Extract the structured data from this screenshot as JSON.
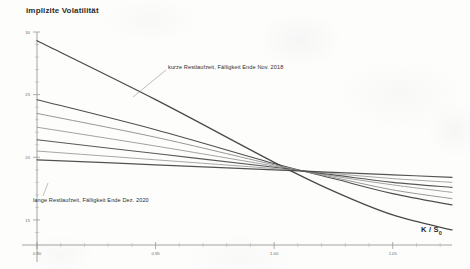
{
  "chart": {
    "title": "implizite Volatilität",
    "xlabel": "K / S",
    "xlabel_sub": "0",
    "annotations": {
      "short": "kurze Restlaufzeit, Fälligkeit Ende Nov. 2018",
      "long": "lange Restlaufzeit, Fälligkeit Ende Dez. 2020"
    }
  },
  "chart_data": {
    "type": "line",
    "title": "implizite Volatilität",
    "subtitle": "",
    "xlabel": "K / S0",
    "ylabel": "implizite Volatilität",
    "xlim": [
      0.9,
      1.075
    ],
    "ylim": [
      13.0,
      30.0
    ],
    "xticks": [
      0.9,
      0.95,
      1.0,
      1.05
    ],
    "xtick_labels": [
      "0.90",
      "0.95",
      "1.00",
      "1.05"
    ],
    "yticks": [
      15,
      20,
      25,
      30
    ],
    "ytick_labels": [
      "15",
      "20",
      "25",
      "30"
    ],
    "yminor_ticks": [
      14,
      16,
      17,
      18,
      19,
      21,
      22,
      23,
      24,
      26,
      27,
      28,
      29
    ],
    "grid": false,
    "legend": "none",
    "annotations": [
      {
        "text": "kurze Restlaufzeit, Fälligkeit Ende Nov. 2018",
        "points_to_series": "Nov. 2018 (kurze Restlaufzeit)",
        "point_x": 0.975,
        "point_y": 21.3
      },
      {
        "text": "lange Restlaufzeit, Fälligkeit Ende Dez. 2020",
        "points_to_series": "Dez. 2020 (lange Restlaufzeit)",
        "point_x": 0.916,
        "point_y": 18.6
      }
    ],
    "x": [
      0.9,
      0.95,
      1.0,
      1.025,
      1.05,
      1.075
    ],
    "series": [
      {
        "name": "Nov. 2018 (kurze Restlaufzeit)",
        "color": "#3a3a3a",
        "width": 1.3,
        "values": [
          29.3,
          24.6,
          19.6,
          17.3,
          15.4,
          14.2
        ]
      },
      {
        "name": "Laufzeit 2",
        "color": "#3f3f3f",
        "width": 1.1,
        "values": [
          24.6,
          22.2,
          19.5,
          18.3,
          17.1,
          16.2
        ]
      },
      {
        "name": "Laufzeit 3",
        "color": "#8e8e8e",
        "width": 1.0,
        "values": [
          23.5,
          21.6,
          19.4,
          18.4,
          17.4,
          16.7
        ]
      },
      {
        "name": "Laufzeit 4",
        "color": "#9a9a9a",
        "width": 1.0,
        "values": [
          22.4,
          20.9,
          19.3,
          18.5,
          17.8,
          17.2
        ]
      },
      {
        "name": "Laufzeit 5",
        "color": "#4a4a4a",
        "width": 1.1,
        "values": [
          21.4,
          20.3,
          19.2,
          18.6,
          18.0,
          17.6
        ]
      },
      {
        "name": "Laufzeit 6",
        "color": "#9e9e9e",
        "width": 1.0,
        "values": [
          20.5,
          19.8,
          19.1,
          18.7,
          18.3,
          18.0
        ]
      },
      {
        "name": "Dez. 2020 (lange Restlaufzeit)",
        "color": "#444444",
        "width": 1.2,
        "values": [
          19.8,
          19.4,
          19.0,
          18.8,
          18.6,
          18.4
        ]
      }
    ]
  }
}
